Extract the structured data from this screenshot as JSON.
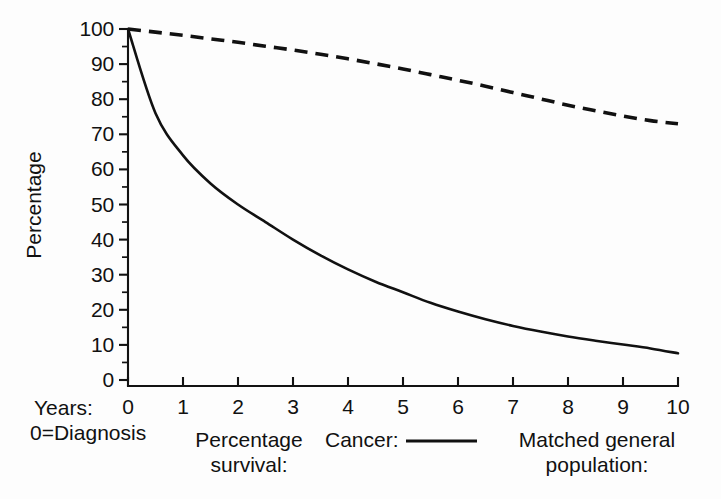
{
  "chart_data": {
    "type": "line",
    "title": "",
    "xlabel": "Years: 0 = Diagnosis",
    "ylabel": "Percentage",
    "xlim": [
      0,
      10
    ],
    "ylim": [
      0,
      100
    ],
    "grid": false,
    "legend_position": "below-axis",
    "x_ticks": [
      "0",
      "1",
      "2",
      "3",
      "4",
      "5",
      "6",
      "7",
      "8",
      "9",
      "10"
    ],
    "y_ticks": [
      "0",
      "10",
      "20",
      "30",
      "40",
      "50",
      "60",
      "70",
      "80",
      "90",
      "100"
    ],
    "y_minor_ticks": [
      5,
      15,
      25,
      35,
      45,
      55,
      65,
      75,
      85,
      95
    ],
    "x": [
      0,
      0.5,
      1,
      1.5,
      2,
      2.5,
      3,
      3.5,
      4,
      4.5,
      5,
      5.5,
      6,
      6.5,
      7,
      7.5,
      8,
      8.5,
      9,
      9.5,
      10
    ],
    "series": [
      {
        "name": "Cancer:",
        "style": "solid",
        "color": "#111111",
        "values": [
          100,
          76,
          64,
          56,
          50,
          45,
          40,
          35.5,
          31.5,
          28,
          25,
          22,
          19.5,
          17.3,
          15.4,
          13.8,
          12.4,
          11.2,
          10.1,
          9.0,
          7.6
        ]
      },
      {
        "name": "Matched general population:",
        "style": "dashed",
        "color": "#111111",
        "values": [
          100,
          99.1,
          98.2,
          97.2,
          96.2,
          95.1,
          94.0,
          92.8,
          91.5,
          90.1,
          88.6,
          87.0,
          85.4,
          83.7,
          81.9,
          80.1,
          78.3,
          76.7,
          75.2,
          73.9,
          73.0
        ]
      }
    ]
  },
  "axis": {
    "y_title": "Percentage",
    "x_prefix": "Years:",
    "x_note": "0=Diagnosis"
  },
  "legend": {
    "group_label_line1": "Percentage",
    "group_label_line2": "survival:",
    "entry_cancer": "Cancer:",
    "entry_matched_line1": "Matched general",
    "entry_matched_line2": "population:"
  },
  "colors": {
    "ink": "#111111",
    "background": "#fdfdfd"
  }
}
